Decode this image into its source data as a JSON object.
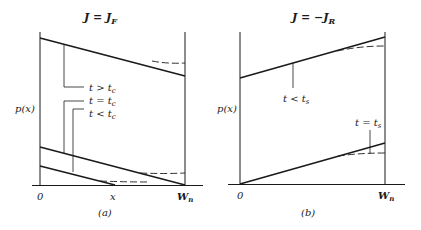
{
  "panels": [
    {
      "id": "a",
      "title_lhs": "J",
      "title_eq": " = ",
      "title_rhs": "J",
      "title_sub": "F",
      "ylabel": "p(x)",
      "xlabel_origin": "0",
      "xlabel_mid": "x",
      "xlabel_end": "W",
      "xlabel_end_sub": "n",
      "caption": "(a)",
      "curve_labels": [
        {
          "main": "t > t",
          "sub": "c"
        },
        {
          "main": "t = t",
          "sub": "c"
        },
        {
          "main": "t < t",
          "sub": "c"
        }
      ]
    },
    {
      "id": "b",
      "title_lhs": "J",
      "title_eq": " = −",
      "title_rhs": "J",
      "title_sub": "R",
      "ylabel": "p(x)",
      "xlabel_origin": "0",
      "xlabel_end": "W",
      "xlabel_end_sub": "n",
      "caption": "(b)",
      "curve_labels": [
        {
          "main": "t < t",
          "sub": "s"
        },
        {
          "main": "t = t",
          "sub": "s"
        }
      ]
    }
  ],
  "colors": {
    "ink": "#1a1a1a",
    "background": "#ffffff"
  }
}
